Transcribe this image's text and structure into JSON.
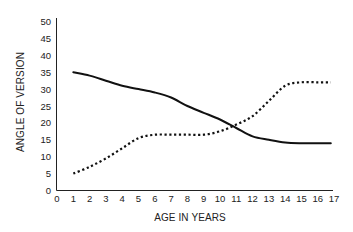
{
  "chart_data": {
    "type": "line",
    "title": "",
    "xlabel": "AGE IN YEARS",
    "ylabel": "ANGLE OF VERSION",
    "xlim": [
      0,
      17
    ],
    "ylim": [
      0,
      50
    ],
    "x_ticks": [
      0,
      1,
      2,
      3,
      4,
      5,
      6,
      7,
      8,
      9,
      10,
      11,
      12,
      13,
      14,
      15,
      16,
      17
    ],
    "y_ticks": [
      0,
      5,
      10,
      15,
      20,
      25,
      30,
      35,
      40,
      45,
      50
    ],
    "grid": false,
    "legend": null,
    "x": [
      1,
      2,
      3,
      4,
      5,
      6,
      7,
      8,
      9,
      10,
      11,
      12,
      13,
      14,
      15,
      16,
      17
    ],
    "series": [
      {
        "name": "solid line",
        "style": "solid",
        "color": "#111111",
        "values": [
          35,
          34,
          32.5,
          31,
          30,
          29,
          27.5,
          25,
          23,
          21,
          18.5,
          16,
          15,
          14.2,
          14,
          14,
          14
        ]
      },
      {
        "name": "dotted line",
        "style": "dotted",
        "color": "#111111",
        "values": [
          5,
          7,
          9.5,
          12.5,
          15.5,
          16.5,
          16.5,
          16.5,
          16.5,
          17.5,
          19.5,
          22,
          26.5,
          31,
          32,
          32,
          32
        ]
      }
    ]
  },
  "axes": {
    "x_label": "AGE IN YEARS",
    "y_label": "ANGLE OF VERSION",
    "x_tick_labels": [
      "0",
      "1",
      "2",
      "3",
      "4",
      "5",
      "6",
      "7",
      "8",
      "9",
      "10",
      "11",
      "12",
      "13",
      "14",
      "15",
      "16",
      "17"
    ],
    "y_tick_labels": [
      "0",
      "5",
      "10",
      "15",
      "20",
      "25",
      "30",
      "35",
      "40",
      "45",
      "50"
    ]
  }
}
